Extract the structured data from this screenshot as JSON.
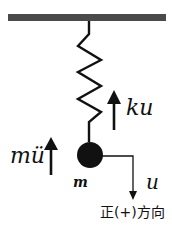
{
  "diagram": {
    "type": "spring-mass free body diagram",
    "colors": {
      "ink": "#111111",
      "ceiling": "#4a4a4a",
      "background": "#ffffff"
    },
    "ceiling": {
      "label": ""
    },
    "spring": {
      "label": ""
    },
    "mass": {
      "label": "m"
    },
    "forces": {
      "spring_force": {
        "label": "ku",
        "direction": "up"
      },
      "inertial_force": {
        "label": "mü",
        "direction": "up"
      }
    },
    "displacement": {
      "label": "u",
      "direction": "down",
      "positive_direction_label": "正(+)方向"
    }
  }
}
